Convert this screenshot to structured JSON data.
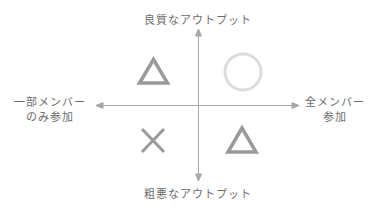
{
  "diagram": {
    "axes": {
      "top": "良質なアウトプット",
      "bottom": "粗悪なアウトプット",
      "left_line1": "一部メンバー",
      "left_line2": "のみ参加",
      "right_line1": "全メンバー",
      "right_line2": "参加"
    },
    "quadrants": [
      {
        "position": "top-left",
        "symbol": "triangle",
        "meaning": "△"
      },
      {
        "position": "top-right",
        "symbol": "circle",
        "meaning": "○"
      },
      {
        "position": "bottom-left",
        "symbol": "cross",
        "meaning": "×"
      },
      {
        "position": "bottom-right",
        "symbol": "triangle",
        "meaning": "△"
      }
    ],
    "colors": {
      "axis": "#a8a8a8",
      "symbol": "#9a9a9a",
      "circle": "#dcdcdc",
      "text": "#6b6b6b"
    }
  }
}
